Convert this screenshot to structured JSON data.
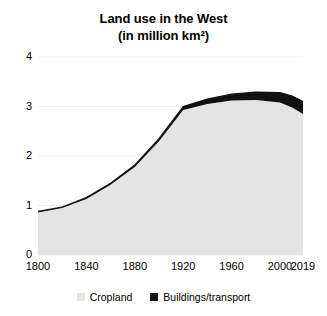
{
  "chart_data": {
    "type": "area",
    "title": "Land use in the West",
    "subtitle": "(in million km²)",
    "xlabel": "",
    "ylabel": "",
    "stacked": true,
    "grid": true,
    "legend_position": "bottom",
    "ylim": [
      0,
      4
    ],
    "xlim": [
      1800,
      2019
    ],
    "yticks": [
      "0",
      "1",
      "2",
      "3",
      "4"
    ],
    "ytick_values": [
      0,
      1,
      2,
      3,
      4
    ],
    "xticks": [
      "1800",
      "1840",
      "1880",
      "1920",
      "1960",
      "2000",
      "2019"
    ],
    "xtick_values": [
      1800,
      1840,
      1880,
      1920,
      1960,
      2000,
      2019
    ],
    "x": [
      1800,
      1820,
      1840,
      1860,
      1880,
      1900,
      1920,
      1940,
      1960,
      1980,
      2000,
      2010,
      2019
    ],
    "series": [
      {
        "name": "Cropland",
        "color": "#E4E4E4",
        "values": [
          0.86,
          0.95,
          1.13,
          1.42,
          1.78,
          2.3,
          2.93,
          3.05,
          3.12,
          3.13,
          3.08,
          2.98,
          2.85
        ]
      },
      {
        "name": "Buildings/transport",
        "color": "#111111",
        "values": [
          0.02,
          0.02,
          0.03,
          0.03,
          0.04,
          0.05,
          0.07,
          0.1,
          0.13,
          0.16,
          0.2,
          0.23,
          0.25
        ]
      }
    ],
    "totals": [
      0.88,
      0.97,
      1.16,
      1.45,
      1.82,
      2.35,
      3.0,
      3.15,
      3.25,
      3.29,
      3.28,
      3.21,
      3.1
    ]
  },
  "legend": {
    "items": [
      {
        "label": "Cropland",
        "color": "#E4E4E4"
      },
      {
        "label": "Buildings/transport",
        "color": "#111111"
      }
    ]
  }
}
